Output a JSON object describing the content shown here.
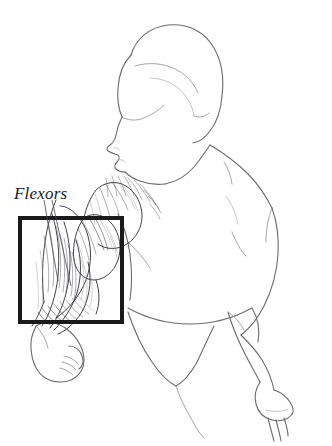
{
  "figure": {
    "title": "Flexors",
    "background_color": "#ffffff",
    "ink_color": "#1a1a1a",
    "outline_color": "#6b6b72"
  },
  "labels": [
    {
      "id": "flexors",
      "text": "Flexors",
      "style": "italic-serif",
      "x": 14,
      "y": 184,
      "font_size": 17,
      "color": "#1a1a1a"
    }
  ],
  "callout_box": {
    "name": "flexors-detail-box",
    "x": 20,
    "y": 218,
    "width": 102,
    "height": 104,
    "stroke_color": "#1a1a1a",
    "stroke_width": 4,
    "fill": "none"
  },
  "leader_lines": [
    {
      "name": "leader-line-1",
      "x1": 44,
      "y1": 200,
      "x2": 58,
      "y2": 280
    },
    {
      "name": "leader-line-2",
      "x1": 52,
      "y1": 200,
      "x2": 70,
      "y2": 285
    }
  ],
  "anatomy_parts": [
    {
      "name": "head-profile",
      "description": "head in left-facing profile with hair"
    },
    {
      "name": "neck",
      "description": "neck connecting head to shoulders"
    },
    {
      "name": "shoulder-deltoid",
      "description": "right deltoid shoulder muscle, shaded"
    },
    {
      "name": "upper-arm-biceps",
      "description": "biceps brachii with fiber striation"
    },
    {
      "name": "forearm-flexors",
      "description": "forearm flexor muscle group, detailed fibers"
    },
    {
      "name": "fist-hand-left",
      "description": "closed fist below the callout box"
    },
    {
      "name": "back-torso",
      "description": "back and lateral torso outline"
    },
    {
      "name": "hip-brief",
      "description": "undergarment brief line across hip"
    },
    {
      "name": "far-arm",
      "description": "far arm hanging down along the body"
    },
    {
      "name": "far-hand",
      "description": "far hand with fingers at lower right"
    },
    {
      "name": "leg-thigh",
      "description": "upper thigh outline"
    }
  ]
}
